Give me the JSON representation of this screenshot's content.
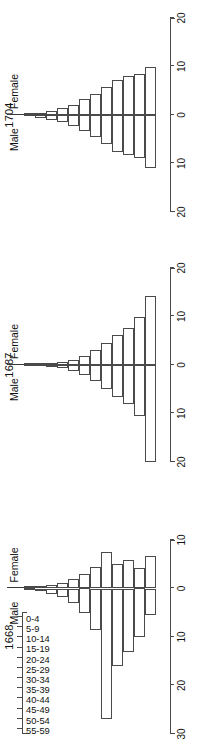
{
  "figure": {
    "age_axis_title": "Age",
    "axis_title": "% of population",
    "male_label": "Male",
    "female_label": "Female",
    "age_groups": [
      "0-4",
      "5-9",
      "10-14",
      "15-19",
      "20-24",
      "25-29",
      "30-34",
      "35-39",
      "40-44",
      "45-49",
      "50-54",
      "55-59"
    ],
    "line_color": "#4a4a4a",
    "text_color": "#111111"
  },
  "chart_data": {
    "type": "bar",
    "subtitle": "",
    "xlabel": "% of population",
    "ylabel": "Age",
    "grid": false,
    "legend_position": "inline",
    "orientation": "horizontal-population-pyramid",
    "categories": [
      "0-4",
      "5-9",
      "10-14",
      "15-19",
      "20-24",
      "25-29",
      "30-34",
      "35-39",
      "40-44",
      "45-49",
      "50-54",
      "55-59"
    ],
    "panels": [
      {
        "name": "1704",
        "title": "1704",
        "xlim": [
          -20,
          20
        ],
        "xticks": [
          -20,
          -10,
          0,
          10,
          20
        ],
        "xticklabels": [
          "20",
          "10",
          "0",
          "10",
          "20"
        ],
        "series": [
          {
            "name": "Male",
            "values": [
              11.0,
              8.8,
              8.3,
              7.6,
              6.0,
              4.6,
              3.3,
              2.2,
              1.5,
              1.0,
              0.6,
              0.3
            ]
          },
          {
            "name": "Female",
            "values": [
              9.9,
              8.5,
              8.0,
              7.2,
              5.7,
              4.4,
              3.2,
              2.1,
              1.4,
              0.9,
              0.5,
              0.3
            ]
          }
        ]
      },
      {
        "name": "1687",
        "title": "1687",
        "xlim": [
          -20,
          20
        ],
        "xticks": [
          -20,
          -10,
          0,
          10,
          20
        ],
        "xticklabels": [
          "20",
          "10",
          "0",
          "10",
          "20"
        ],
        "series": [
          {
            "name": "Male",
            "values": [
              20.0,
              10.5,
              8.0,
              6.6,
              5.0,
              3.4,
              2.0,
              1.2,
              0.7,
              0.4,
              0.2,
              0.1
            ]
          },
          {
            "name": "Female",
            "values": [
              14.2,
              9.8,
              7.6,
              6.2,
              4.6,
              3.1,
              1.9,
              1.1,
              0.6,
              0.4,
              0.2,
              0.1
            ]
          }
        ]
      },
      {
        "name": "1668",
        "title": "1668",
        "xlim": [
          -30,
          10
        ],
        "xticks": [
          -30,
          -20,
          -10,
          0,
          10
        ],
        "xticklabels": [
          "30",
          "20",
          "10",
          "0",
          "10"
        ],
        "series": [
          {
            "name": "Male",
            "values": [
              5.5,
              10.0,
              13.0,
              16.0,
              27.0,
              8.5,
              5.0,
              3.0,
              1.8,
              1.1,
              0.6,
              0.3
            ]
          },
          {
            "name": "Female",
            "values": [
              6.8,
              4.3,
              5.8,
              5.1,
              7.5,
              4.4,
              3.0,
              2.0,
              1.2,
              0.8,
              0.4,
              0.2
            ]
          }
        ]
      }
    ]
  }
}
